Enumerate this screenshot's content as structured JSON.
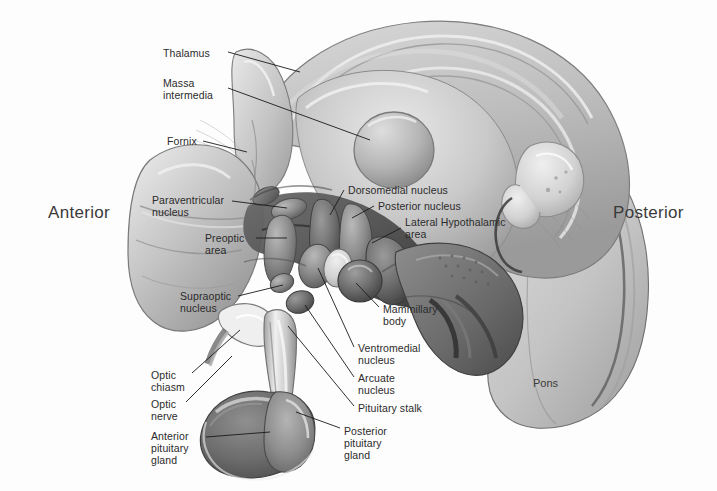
{
  "figure": {
    "background_color": "#fdfdfd",
    "label_color": "#2b2b2b",
    "leader_color": "#1a1a1a",
    "width": 717,
    "height": 491
  },
  "orientation": {
    "anterior": "Anterior",
    "posterior": "Posterior"
  },
  "region_labels": {
    "pons": "Pons"
  },
  "labels": [
    {
      "id": "thalamus",
      "text": "Thalamus",
      "x": 163,
      "y": 47
    },
    {
      "id": "massa-intermedia",
      "text": "Massa\nintermedia",
      "x": 163,
      "y": 77
    },
    {
      "id": "fornix",
      "text": "Fornix",
      "x": 167,
      "y": 135
    },
    {
      "id": "paraventricular",
      "text": "Paraventricular\nnucleus",
      "x": 152,
      "y": 194
    },
    {
      "id": "preoptic-area",
      "text": "Preoptic\narea",
      "x": 205,
      "y": 232
    },
    {
      "id": "supraoptic",
      "text": "Supraoptic\nnucleus",
      "x": 180,
      "y": 290
    },
    {
      "id": "dorsomedial",
      "text": "Dorsomedial nucleus",
      "x": 348,
      "y": 184
    },
    {
      "id": "posterior-nucleus",
      "text": "Posterior nucleus",
      "x": 378,
      "y": 200
    },
    {
      "id": "lateral-hypothalamic",
      "text": "Lateral Hypothalamic\narea",
      "x": 405,
      "y": 216
    },
    {
      "id": "mammillary-body",
      "text": "Mammillary\nbody",
      "x": 383,
      "y": 303
    },
    {
      "id": "ventromedial",
      "text": "Ventromedial\nnucleus",
      "x": 358,
      "y": 342
    },
    {
      "id": "arcuate",
      "text": "Arcuate\nnucleus",
      "x": 358,
      "y": 372
    },
    {
      "id": "pituitary-stalk",
      "text": "Pituitary stalk",
      "x": 358,
      "y": 402
    },
    {
      "id": "optic-chiasm",
      "text": "Optic\nchiasm",
      "x": 151,
      "y": 369
    },
    {
      "id": "optic-nerve",
      "text": "Optic\nnerve",
      "x": 151,
      "y": 398
    },
    {
      "id": "anterior-pituitary",
      "text": "Anterior\npituitary\ngland",
      "x": 151,
      "y": 430
    },
    {
      "id": "posterior-pituitary",
      "text": "Posterior\npituitary\ngland",
      "x": 344,
      "y": 425
    }
  ],
  "leaders": [
    {
      "id": "leader-thalamus",
      "points": "228,52 300,72"
    },
    {
      "id": "leader-massa-intermedia",
      "points": "228,88 370,140"
    },
    {
      "id": "leader-fornix",
      "points": "203,141 247,152"
    },
    {
      "id": "leader-paraventricular",
      "points": "232,201 287,208"
    },
    {
      "id": "leader-preoptic-area",
      "points": "256,238 287,238"
    },
    {
      "id": "leader-supraoptic",
      "points": "238,296 283,285"
    },
    {
      "id": "leader-dorsomedial",
      "points": "344,190 330,215"
    },
    {
      "id": "leader-posterior-nucleus",
      "points": "374,206 352,218"
    },
    {
      "id": "leader-lateral-hypothalamic",
      "points": "401,228 372,243"
    },
    {
      "id": "leader-mammillary-body",
      "points": "379,307 356,283"
    },
    {
      "id": "leader-ventromedial",
      "points": "354,347 318,268"
    },
    {
      "id": "leader-arcuate",
      "points": "354,377 305,305"
    },
    {
      "id": "leader-pituitary-stalk",
      "points": "354,406 288,326"
    },
    {
      "id": "leader-optic-chiasm",
      "points": "192,373 240,330"
    },
    {
      "id": "leader-optic-nerve",
      "points": "186,402 232,356"
    },
    {
      "id": "leader-anterior-pituitary",
      "points": "206,437 270,432"
    },
    {
      "id": "leader-posterior-pituitary",
      "points": "340,428 296,412"
    }
  ]
}
